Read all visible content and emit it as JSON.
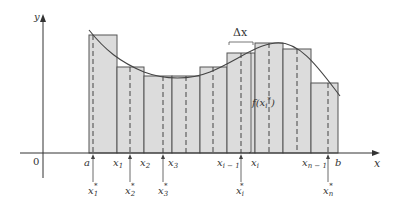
{
  "diagram": {
    "axes": {
      "x_label": "x",
      "y_label": "y",
      "origin_label": "0"
    },
    "delta_label": "Δx",
    "function_label": "f(x",
    "function_label_sub": "i",
    "function_label_sup": "*",
    "function_label_close": ")",
    "partition_labels": [
      {
        "main": "a",
        "sub": ""
      },
      {
        "main": "x",
        "sub": "1"
      },
      {
        "main": "x",
        "sub": "2"
      },
      {
        "main": "x",
        "sub": "3"
      },
      {
        "main": "x",
        "sub": "i − 1"
      },
      {
        "main": "x",
        "sub": "i"
      },
      {
        "main": "x",
        "sub": "n − 1"
      },
      {
        "main": "b",
        "sub": ""
      }
    ],
    "sample_labels": [
      {
        "main": "x",
        "sub": "1",
        "sup": "*"
      },
      {
        "main": "x",
        "sub": "2",
        "sup": "*"
      },
      {
        "main": "x",
        "sub": "3",
        "sup": "*"
      },
      {
        "main": "x",
        "sub": "i",
        "sup": "*"
      },
      {
        "main": "x",
        "sub": "n",
        "sup": "*"
      }
    ],
    "colors": {
      "rect_fill": "#dcdcdc",
      "rect_stroke": "#555555",
      "curve": "#444444",
      "axis": "#333333"
    }
  }
}
